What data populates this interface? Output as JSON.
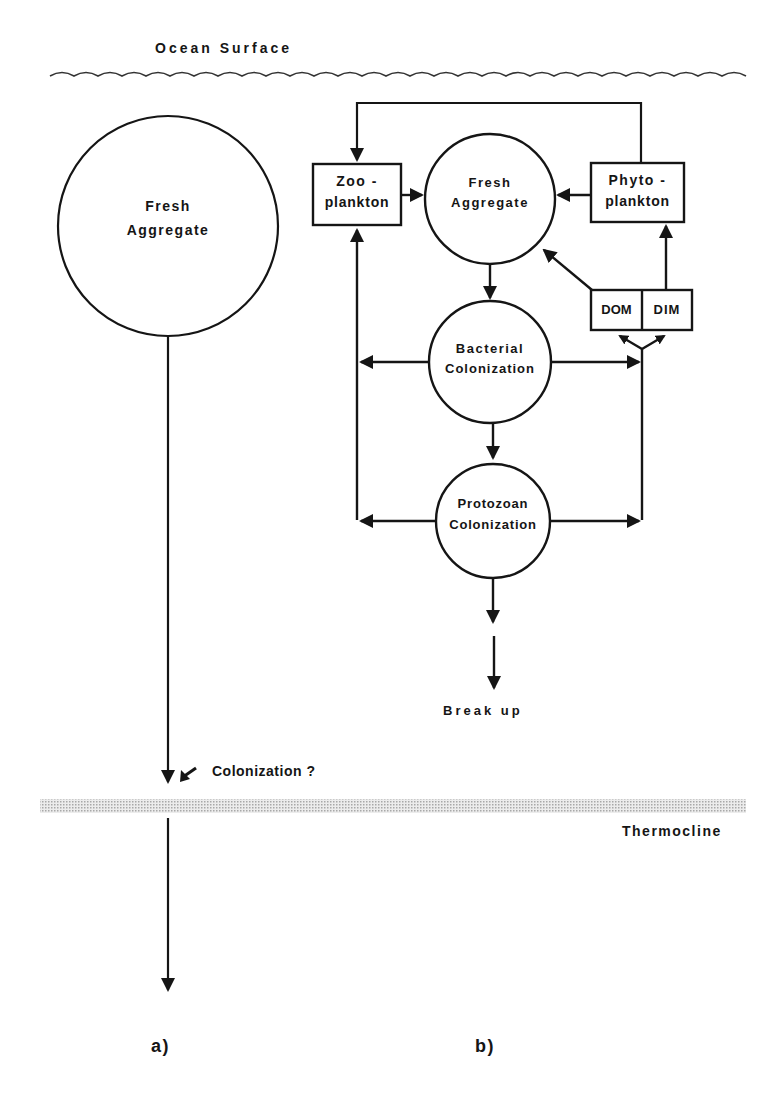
{
  "figure": {
    "surface_label": "Ocean Surface",
    "thermocline_label": "Thermocline",
    "panel_a": {
      "label": "a)",
      "aggregate_label_line1": "Fresh",
      "aggregate_label_line2": "Aggregate",
      "colonization_label": "Colonization ?"
    },
    "panel_b": {
      "label": "b)",
      "zooplankton_line1": "Zoo -",
      "zooplankton_line2": "plankton",
      "fresh_line1": "Fresh",
      "fresh_line2": "Aggregate",
      "phytoplankton_line1": "Phyto -",
      "phytoplankton_line2": "plankton",
      "dom_label": "DOM",
      "dim_label": "DIM",
      "bacterial_line1": "Bacterial",
      "bacterial_line2": "Colonization",
      "protozoan_line1": "Protozoan",
      "protozoan_line2": "Colonization",
      "break_up_label": "Break up"
    },
    "colors": {
      "ink": "#151515",
      "thermocline_band": "#d6d6d6",
      "background": "#ffffff"
    }
  }
}
